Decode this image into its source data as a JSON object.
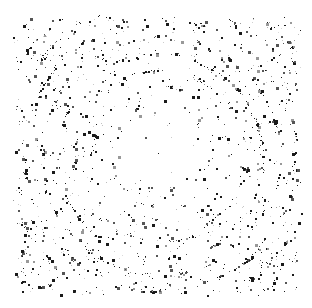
{
  "image": {
    "title": "Concentric Ring Halftone Speckle Pattern",
    "kind": "dithered-speckle-texture",
    "width": 312,
    "height": 308,
    "background_color": "#ffffff",
    "dot_color_dark": "#1a1a1a",
    "dot_color_mid": "#555555",
    "dot_color_light": "#999999"
  },
  "pattern": {
    "structure": "concentric-rings",
    "center_x": 160,
    "center_y": 155,
    "ring_spacing_px": 17,
    "ring_band_width_px": 4.2,
    "radial_density_falloff": "increasing-outward",
    "center_sparse_radius_px": 34,
    "plate_left": 13,
    "plate_top": 15,
    "plate_right": 301,
    "plate_bottom": 296,
    "edge_fade_px": 7,
    "dot_min_size_px": 1,
    "dot_max_size_px": 3,
    "approx_dot_count": 2600,
    "noise_seed": 20240517,
    "arc_jitter_px": 2.6,
    "angular_noise_scale": 7.5,
    "base_noise_fraction": 0.28
  },
  "chart_data": {
    "type": "scatter",
    "xlabel": "",
    "ylabel": "",
    "xlim": [
      0,
      312
    ],
    "ylim": [
      0,
      308
    ],
    "grid": false,
    "legend": null,
    "series": [
      {
        "name": "ring-speckles",
        "description": "Dots clustered along concentric circular bands about the center",
        "center": [
          160,
          155
        ],
        "ring_radii": [
          34,
          51,
          68,
          85,
          102,
          119,
          136,
          153,
          170,
          187,
          204
        ],
        "ring_point_counts": [
          26,
          52,
          78,
          104,
          128,
          150,
          168,
          182,
          190,
          160,
          96
        ]
      },
      {
        "name": "background-speckles",
        "description": "Uniform random dots filling the plate with outward density gradient",
        "point_count": 720
      }
    ]
  }
}
